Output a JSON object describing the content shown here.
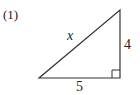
{
  "problem": {
    "number_label": "(1)",
    "hypotenuse_label": "x",
    "vertical_leg_label": "4",
    "horizontal_leg_label": "5"
  },
  "shape": {
    "type": "right-triangle",
    "right_angle_corner": "bottom-right",
    "stroke_color": "#333333"
  }
}
